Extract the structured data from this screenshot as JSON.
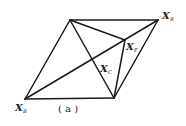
{
  "diagram": {
    "caption": "( a )",
    "points": {
      "TL": {
        "x": 70,
        "y": 20
      },
      "XR": {
        "x": 158,
        "y": 20
      },
      "XF": {
        "x": 125,
        "y": 40
      },
      "XC": {
        "x": 92,
        "y": 59
      },
      "XB": {
        "x": 25,
        "y": 99
      },
      "BR": {
        "x": 114,
        "y": 98
      }
    },
    "labels": {
      "xr": {
        "main": "X",
        "sub": "R"
      },
      "xf": {
        "main": "X",
        "sub": "F"
      },
      "xc": {
        "main": "X",
        "sub": "C"
      },
      "xb": {
        "main": "X",
        "sub": "B"
      }
    },
    "edges": [
      [
        "TL",
        "XR"
      ],
      [
        "XR",
        "BR"
      ],
      [
        "BR",
        "XB"
      ],
      [
        "XB",
        "TL"
      ],
      [
        "XB",
        "XR"
      ],
      [
        "TL",
        "BR"
      ],
      [
        "TL",
        "XF"
      ],
      [
        "XF",
        "BR"
      ]
    ],
    "stroke_color": "#1a1a1a"
  }
}
